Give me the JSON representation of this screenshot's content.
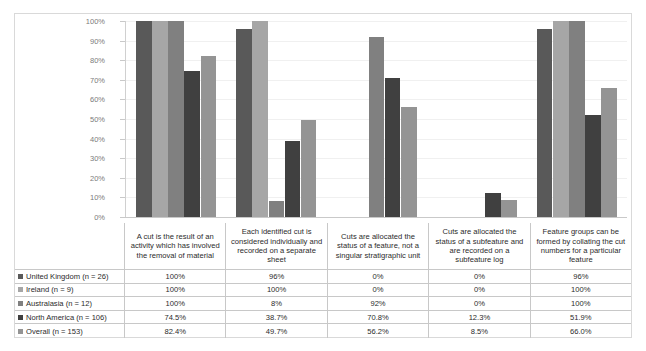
{
  "chart_data": {
    "type": "bar",
    "title": "",
    "xlabel": "",
    "ylabel": "",
    "ylim": [
      0,
      100
    ],
    "grid": true,
    "legend_position": "table-left",
    "ytick_labels": [
      "100%",
      "90%",
      "80%",
      "70%",
      "60%",
      "50%",
      "40%",
      "30%",
      "20%",
      "10%",
      "0%"
    ],
    "ytick_values": [
      100,
      90,
      80,
      70,
      60,
      50,
      40,
      30,
      20,
      10,
      0
    ],
    "categories": [
      "A cut is the result of an activity which has involved the removal of material",
      "Each identified cut  is considered individually and recorded on a separate sheet",
      "Cuts are allocated the status of a feature, not a singular stratigraphic unit",
      "Cuts are allocated the status of a subfeature and are recorded on a subfeature log",
      "Feature groups can be formed by collating the cut numbers for a particular feature"
    ],
    "series": [
      {
        "name": "United Kingdom (n = 26)",
        "color": "#595959",
        "values": [
          100,
          96,
          0,
          0,
          96
        ],
        "labels": [
          "100%",
          "96%",
          "0%",
          "0%",
          "96%"
        ]
      },
      {
        "name": "Ireland (n = 9)",
        "color": "#a6a6a6",
        "values": [
          100,
          100,
          0,
          0,
          100
        ],
        "labels": [
          "100%",
          "100%",
          "0%",
          "0%",
          "100%"
        ]
      },
      {
        "name": "Australasia (n = 12)",
        "color": "#808080",
        "values": [
          100,
          8,
          92,
          0,
          100
        ],
        "labels": [
          "100%",
          "8%",
          "92%",
          "0%",
          "100%"
        ]
      },
      {
        "name": "North America (n = 106)",
        "color": "#404040",
        "values": [
          74.5,
          38.7,
          70.8,
          12.3,
          51.9
        ],
        "labels": [
          "74.5%",
          "38.7%",
          "70.8%",
          "12.3%",
          "51.9%"
        ]
      },
      {
        "name": "Overall (n = 153)",
        "color": "#949494",
        "values": [
          82.4,
          49.7,
          56.2,
          8.5,
          66.0
        ],
        "labels": [
          "82.4%",
          "49.7%",
          "56.2%",
          "8.5%",
          "66.0%"
        ]
      }
    ]
  }
}
